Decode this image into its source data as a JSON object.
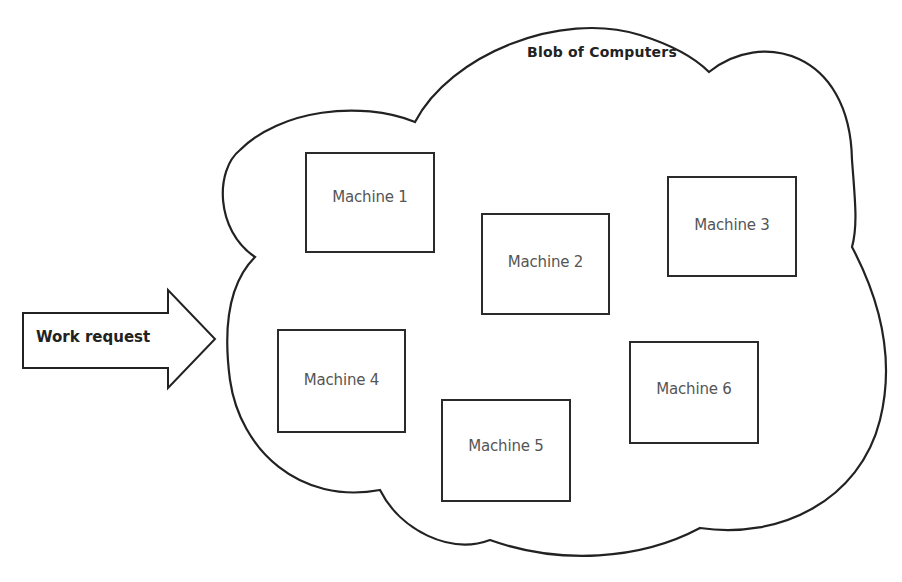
{
  "diagram": {
    "cloud": {
      "title": "Blob of Computers",
      "stroke_color": "#222222"
    },
    "input_arrow": {
      "label": "Work request"
    },
    "machines": [
      {
        "label": "Machine 1",
        "x": 305,
        "y": 152,
        "w": 130,
        "h": 101
      },
      {
        "label": "Machine 2",
        "x": 481,
        "y": 213,
        "w": 129,
        "h": 102
      },
      {
        "label": "Machine 3",
        "x": 667,
        "y": 176,
        "w": 130,
        "h": 101
      },
      {
        "label": "Machine 4",
        "x": 277,
        "y": 329,
        "w": 129,
        "h": 104
      },
      {
        "label": "Machine 5",
        "x": 441,
        "y": 399,
        "w": 130,
        "h": 103
      },
      {
        "label": "Machine 6",
        "x": 629,
        "y": 341,
        "w": 130,
        "h": 103
      }
    ]
  }
}
